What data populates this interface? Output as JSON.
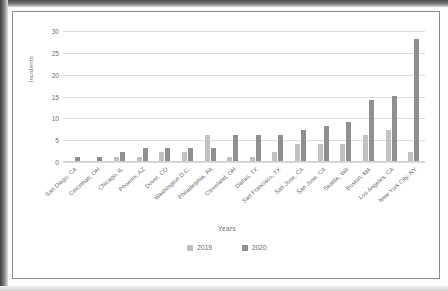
{
  "chart_data": {
    "type": "bar",
    "title": "",
    "xlabel": "Years",
    "ylabel": "Incidents",
    "ylim": [
      0,
      30
    ],
    "yticks": [
      0,
      5,
      10,
      15,
      20,
      25,
      30
    ],
    "grid": true,
    "legend_position": "bottom",
    "categories": [
      "San Diego, CA",
      "Cincinnati, OH",
      "Chicago, IL",
      "Phoenix, AZ",
      "Dover, CO",
      "Washington D.C.",
      "Philadelphia, PA",
      "Cleveland, OH",
      "Dallas, TX",
      "San Francisco, TX",
      "San Jose, CA",
      "San Jose, CA",
      "Seattle, WA",
      "Boston, MA",
      "Los Angeles, CA",
      "New York City, NY"
    ],
    "series": [
      {
        "name": "2019",
        "color": "#c2c2c2",
        "values": [
          0,
          0,
          1,
          1,
          2,
          2,
          6,
          1,
          1,
          2,
          4,
          4,
          4,
          6,
          7,
          2
        ]
      },
      {
        "name": "2020",
        "color": "#8f8f8f",
        "values": [
          1,
          1,
          2,
          3,
          3,
          3,
          3,
          6,
          6,
          6,
          7,
          8,
          9,
          14,
          15,
          28
        ]
      }
    ]
  }
}
